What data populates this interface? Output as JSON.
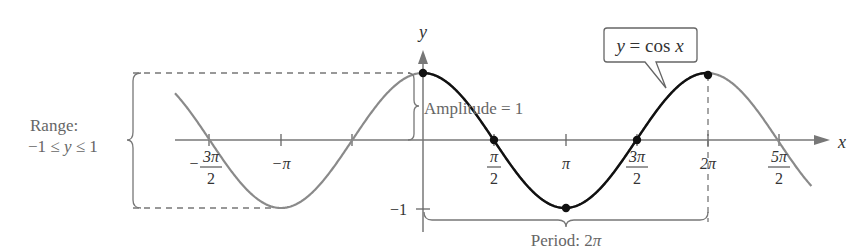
{
  "chart_data": {
    "type": "line",
    "title": "",
    "function": "y = cos x",
    "xlabel": "x",
    "ylabel": "y",
    "xlim": [
      -4.9,
      8.7
    ],
    "ylim": [
      -1,
      1
    ],
    "x_ticks": [
      "-3π/2",
      "-π",
      "-π/2",
      "0",
      "π/2",
      "π",
      "3π/2",
      "2π",
      "5π/2"
    ],
    "x_tick_labels": [
      {
        "num": "3π",
        "den": "2",
        "sign": "−"
      },
      {
        "text": "−π"
      },
      {
        "num": "π",
        "den": "2"
      },
      {
        "text": "π"
      },
      {
        "num": "3π",
        "den": "2"
      },
      {
        "text": "2π"
      },
      {
        "num": "5π",
        "den": "2"
      }
    ],
    "y_tick_labels": [
      "−1"
    ],
    "highlighted_period": {
      "from": "0",
      "to": "2π"
    },
    "key_points": [
      {
        "x": "0",
        "y": 1
      },
      {
        "x": "π/2",
        "y": 0
      },
      {
        "x": "π",
        "y": -1
      },
      {
        "x": "3π/2",
        "y": 0
      },
      {
        "x": "2π",
        "y": 1
      }
    ],
    "annotations": {
      "callout": "y = cos x",
      "amplitude": "Amplitude = 1",
      "period": "Period: 2π",
      "range_title": "Range:",
      "range_value": "−1 ≤ y ≤ 1"
    },
    "grid": false,
    "colors": {
      "gray_curve": "#8a8a8a",
      "highlight_curve": "#111111",
      "axis": "#777777"
    }
  }
}
